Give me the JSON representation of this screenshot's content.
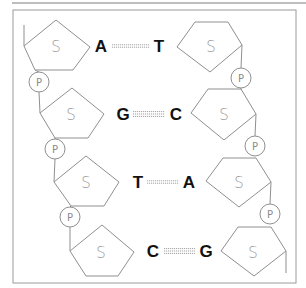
{
  "diagram": {
    "sugar_label": "S",
    "phosphate_label": "P",
    "colors": {
      "outline": "#8f8f8f",
      "frame": "#9a9a9a",
      "base_text": "#111111"
    },
    "base_pairs": [
      {
        "left": "A",
        "right": "T",
        "bond_count": 2
      },
      {
        "left": "G",
        "right": "C",
        "bond_count": 3
      },
      {
        "left": "T",
        "right": "A",
        "bond_count": 2
      },
      {
        "left": "C",
        "right": "G",
        "bond_count": 3
      }
    ]
  }
}
